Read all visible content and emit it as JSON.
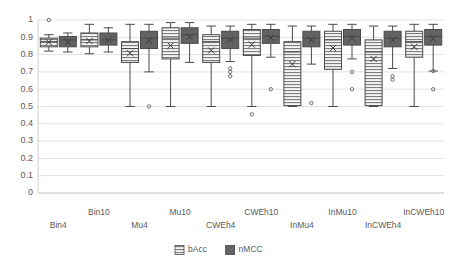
{
  "chart_data": {
    "type": "box",
    "title": "",
    "xlabel": "",
    "ylabel": "",
    "ylim": [
      0,
      1
    ],
    "grid": true,
    "legend_position": "bottom",
    "y_ticks": [
      "0",
      "0.1",
      "0.2",
      "0.3",
      "0.4",
      "0.5",
      "0.6",
      "0.7",
      "0.8",
      "0.9",
      "1"
    ],
    "categories": [
      "Bin4",
      "Bin10",
      "Mu4",
      "Mu10",
      "CWEh4",
      "CWEh10",
      "InMu4",
      "InMu10",
      "InCWEh4",
      "InCWEh10"
    ],
    "legend": [
      {
        "name": "bAcc",
        "color": "#f2f2f2",
        "pattern": "horizontal-stripes"
      },
      {
        "name": "nMCC",
        "color": "#636363",
        "pattern": "solid"
      }
    ],
    "series": [
      {
        "name": "bAcc",
        "boxes": [
          {
            "category": "Bin4",
            "min": 0.82,
            "q1": 0.845,
            "median": 0.875,
            "mean": 0.872,
            "q3": 0.895,
            "max": 0.915,
            "outliers": [
              1.0
            ]
          },
          {
            "category": "Bin10",
            "min": 0.805,
            "q1": 0.845,
            "median": 0.885,
            "mean": 0.879,
            "q3": 0.925,
            "max": 0.975,
            "outliers": []
          },
          {
            "category": "Mu4",
            "min": 0.5,
            "q1": 0.755,
            "median": 0.835,
            "mean": 0.808,
            "q3": 0.875,
            "max": 0.975,
            "outliers": []
          },
          {
            "category": "Mu10",
            "min": 0.5,
            "q1": 0.775,
            "median": 0.895,
            "mean": 0.852,
            "q3": 0.955,
            "max": 0.985,
            "outliers": []
          },
          {
            "category": "CWEh4",
            "min": 0.5,
            "q1": 0.755,
            "median": 0.875,
            "mean": 0.824,
            "q3": 0.915,
            "max": 0.965,
            "outliers": []
          },
          {
            "category": "CWEh10",
            "min": 0.5,
            "q1": 0.795,
            "median": 0.895,
            "mean": 0.858,
            "q3": 0.945,
            "max": 0.975,
            "outliers": [
              0.455
            ]
          },
          {
            "category": "InMu4",
            "min": 0.5,
            "q1": 0.505,
            "median": 0.815,
            "mean": 0.745,
            "q3": 0.875,
            "max": 0.965,
            "outliers": []
          },
          {
            "category": "InMu10",
            "min": 0.5,
            "q1": 0.715,
            "median": 0.885,
            "mean": 0.838,
            "q3": 0.935,
            "max": 0.975,
            "outliers": []
          },
          {
            "category": "InCWEh4",
            "min": 0.5,
            "q1": 0.505,
            "median": 0.815,
            "mean": 0.775,
            "q3": 0.885,
            "max": 0.965,
            "outliers": []
          },
          {
            "category": "InCWEh10",
            "min": 0.5,
            "q1": 0.785,
            "median": 0.875,
            "mean": 0.845,
            "q3": 0.935,
            "max": 0.975,
            "outliers": []
          }
        ]
      },
      {
        "name": "nMCC",
        "boxes": [
          {
            "category": "Bin4",
            "min": 0.815,
            "q1": 0.845,
            "median": 0.885,
            "mean": 0.872,
            "q3": 0.905,
            "max": 0.925,
            "outliers": []
          },
          {
            "category": "Bin10",
            "min": 0.815,
            "q1": 0.855,
            "median": 0.885,
            "mean": 0.883,
            "q3": 0.925,
            "max": 0.955,
            "outliers": []
          },
          {
            "category": "Mu4",
            "min": 0.7,
            "q1": 0.835,
            "median": 0.895,
            "mean": 0.881,
            "q3": 0.935,
            "max": 0.975,
            "outliers": [
              0.5
            ]
          },
          {
            "category": "Mu10",
            "min": 0.755,
            "q1": 0.865,
            "median": 0.915,
            "mean": 0.904,
            "q3": 0.955,
            "max": 0.985,
            "outliers": []
          },
          {
            "category": "CWEh4",
            "min": 0.76,
            "q1": 0.835,
            "median": 0.895,
            "mean": 0.885,
            "q3": 0.935,
            "max": 0.965,
            "outliers": [
              0.72,
              0.7,
              0.675
            ]
          },
          {
            "category": "CWEh10",
            "min": 0.785,
            "q1": 0.865,
            "median": 0.905,
            "mean": 0.897,
            "q3": 0.945,
            "max": 0.975,
            "outliers": [
              0.6
            ]
          },
          {
            "category": "InMu4",
            "min": 0.745,
            "q1": 0.845,
            "median": 0.895,
            "mean": 0.885,
            "q3": 0.935,
            "max": 0.965,
            "outliers": [
              0.52
            ]
          },
          {
            "category": "InMu10",
            "min": 0.775,
            "q1": 0.855,
            "median": 0.905,
            "mean": 0.896,
            "q3": 0.945,
            "max": 0.975,
            "outliers": [
              0.7,
              0.6
            ]
          },
          {
            "category": "InCWEh4",
            "min": 0.72,
            "q1": 0.845,
            "median": 0.895,
            "mean": 0.884,
            "q3": 0.935,
            "max": 0.965,
            "outliers": [
              0.675,
              0.655
            ]
          },
          {
            "category": "InCWEh10",
            "min": 0.705,
            "q1": 0.855,
            "median": 0.905,
            "mean": 0.893,
            "q3": 0.945,
            "max": 0.975,
            "outliers": [
              0.705,
              0.6
            ]
          }
        ]
      }
    ]
  }
}
